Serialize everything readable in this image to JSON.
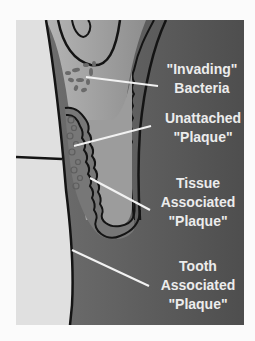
{
  "diagram": {
    "type": "dental-plaque-cross-section",
    "colors": {
      "page_background": "#fbfbfb",
      "tooth_enamel": "#e2e2e2",
      "gum_tissue": "#5a5a5a",
      "pocket_lining": "#9a9a9a",
      "plaque": "#7a7a7a",
      "bacteria": "#6e6e6e",
      "outline": "#141414",
      "label_text": "#ececec",
      "leader_line": "#f2f2f2"
    },
    "labels": [
      {
        "id": "invading-bacteria",
        "lines": [
          "\"Invading\"",
          "Bacteria"
        ]
      },
      {
        "id": "unattached-plaque",
        "lines": [
          "Unattached",
          "\"Plaque\""
        ]
      },
      {
        "id": "tissue-associated-plaque",
        "lines": [
          "Tissue",
          "Associated",
          "\"Plaque\""
        ]
      },
      {
        "id": "tooth-associated-plaque",
        "lines": [
          "Tooth",
          "Associated",
          "\"Plaque\""
        ]
      }
    ]
  }
}
